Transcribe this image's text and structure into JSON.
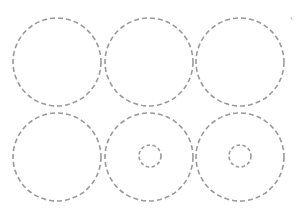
{
  "diagram": {
    "stroke_color": "#9a9a9a",
    "background": "#ffffff",
    "large_radius": 44,
    "small_radius": 11,
    "grid": [
      {
        "row": 1,
        "col": 1,
        "cx": 57,
        "cy": 62,
        "inner": false
      },
      {
        "row": 1,
        "col": 2,
        "cx": 149,
        "cy": 62,
        "inner": false
      },
      {
        "row": 1,
        "col": 3,
        "cx": 240,
        "cy": 62,
        "inner": false
      },
      {
        "row": 2,
        "col": 1,
        "cx": 57,
        "cy": 157,
        "inner": false
      },
      {
        "row": 2,
        "col": 2,
        "cx": 149,
        "cy": 157,
        "inner": true
      },
      {
        "row": 2,
        "col": 3,
        "cx": 240,
        "cy": 157,
        "inner": true
      }
    ]
  }
}
